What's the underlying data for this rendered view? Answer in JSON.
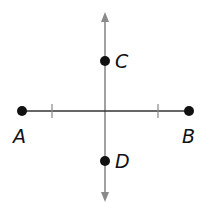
{
  "diagram": {
    "points": [
      {
        "label": "A",
        "x": 22,
        "y": 111
      },
      {
        "label": "B",
        "x": 189,
        "y": 111
      },
      {
        "label": "C",
        "x": 105,
        "y": 61
      },
      {
        "label": "D",
        "x": 105,
        "y": 161
      }
    ],
    "segment_AB": {
      "from": "A",
      "to": "B",
      "color": "#333333",
      "tick_marks_x": [
        52,
        158
      ]
    },
    "perpendicular_line": {
      "x": 105,
      "y_top": 12,
      "y_bottom": 202,
      "color": "#888888",
      "arrows": "both"
    },
    "labels": {
      "A": "A",
      "B": "B",
      "C": "C",
      "D": "D"
    }
  }
}
